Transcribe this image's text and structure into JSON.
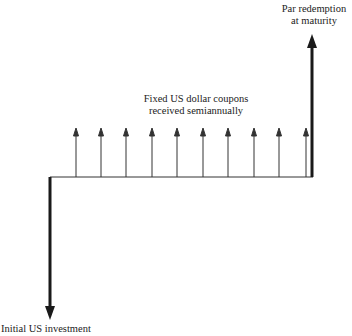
{
  "diagram": {
    "type": "cash-flow-diagram",
    "labels": {
      "par_redemption_line1": "Par redemption",
      "par_redemption_line2": "at maturity",
      "coupons_line1": "Fixed US dollar coupons",
      "coupons_line2": "received semiannually",
      "initial_investment": "Initial US investment"
    },
    "coupon_count": 10,
    "colors": {
      "stroke": "#1a1a1a",
      "text": "#222222",
      "background": "#ffffff"
    }
  }
}
